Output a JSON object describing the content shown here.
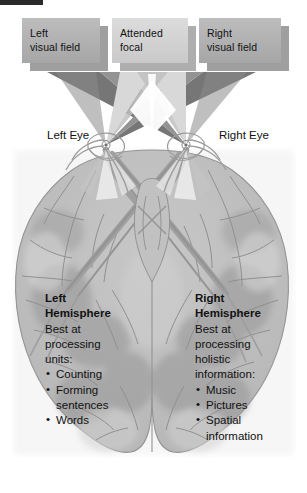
{
  "figure": {
    "type": "anatomical-diagram"
  },
  "colors": {
    "crop_bar": "#2a2a2a",
    "box_side_face": "#b0b0b0",
    "box_mid_face": "#d3d3d3",
    "box_shadow": "#8e8e8e",
    "cone_dark": "#7b7b7b",
    "cone_mid": "#9a9a9a",
    "cone_light": "#cfcfcf",
    "cone_pale": "#e6e6e6",
    "brain_fill": "#bdbdbd",
    "brain_fill_light": "#cccccc",
    "brain_shadow": "#a3a3a3",
    "tract_gray": "#9d9d9d",
    "outline": "#6e6e6e",
    "text": "#111111",
    "background": "#ffffff"
  },
  "field_boxes": [
    {
      "id": "left-visual-field",
      "lines": [
        "Left",
        "visual field"
      ]
    },
    {
      "id": "attended-focal",
      "lines": [
        "Attended",
        "focal"
      ]
    },
    {
      "id": "right-visual-field",
      "lines": [
        "Right",
        "visual field"
      ]
    }
  ],
  "eyes": [
    {
      "id": "left-eye",
      "lines": [
        "Left",
        "Eye"
      ]
    },
    {
      "id": "right-eye",
      "lines": [
        "Right",
        "Eye"
      ]
    }
  ],
  "hemispheres": [
    {
      "id": "left-hemisphere",
      "heading": [
        "Left",
        "Hemisphere"
      ],
      "body": [
        "Best at",
        "processing",
        "units:"
      ],
      "bullets": [
        {
          "lines": [
            "Counting"
          ]
        },
        {
          "lines": [
            "Forming",
            "sentences"
          ]
        },
        {
          "lines": [
            "Words"
          ]
        }
      ]
    },
    {
      "id": "right-hemisphere",
      "heading": [
        "Right",
        "Hemisphere"
      ],
      "body": [
        "Best at",
        "processing",
        "holistic",
        "information:"
      ],
      "bullets": [
        {
          "lines": [
            "Music"
          ]
        },
        {
          "lines": [
            "Pictures"
          ]
        },
        {
          "lines": [
            "Spatial",
            "information"
          ]
        }
      ]
    }
  ],
  "bullet_glyph": "•"
}
